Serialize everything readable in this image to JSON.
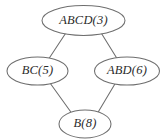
{
  "diagram": {
    "type": "lattice-hasse-diagram",
    "background_color": "#ffffff",
    "stroke_color": "#6e6e6e",
    "text_color": "#2b2b2b",
    "nodes": [
      {
        "id": "top",
        "label": "ABCD(3)",
        "set": "ABCD",
        "value": 3,
        "cx": 83.5,
        "cy": 20.5,
        "rx": 41.5,
        "ry": 15.0
      },
      {
        "id": "left",
        "label": "BC(5)",
        "set": "BC",
        "value": 5,
        "cx": 37.5,
        "cy": 71.0,
        "rx": 30.5,
        "ry": 14.0
      },
      {
        "id": "right",
        "label": "ABD(6)",
        "set": "ABD",
        "value": 6,
        "cx": 127.0,
        "cy": 71.0,
        "rx": 32.5,
        "ry": 14.0
      },
      {
        "id": "bottom",
        "label": "B(8)",
        "set": "B",
        "value": 8,
        "cx": 85.0,
        "cy": 124.0,
        "rx": 26.0,
        "ry": 14.0
      }
    ],
    "edges": [
      {
        "id": "top-left",
        "from": "top",
        "to": "left",
        "x1": 65.5,
        "y1": 33.5,
        "x2": 49.0,
        "y2": 58.5
      },
      {
        "id": "top-right",
        "from": "top",
        "to": "right",
        "x1": 101.5,
        "y1": 33.5,
        "x2": 117.0,
        "y2": 58.5
      },
      {
        "id": "left-bottom",
        "from": "left",
        "to": "bottom",
        "x1": 50.0,
        "y1": 83.0,
        "x2": 70.5,
        "y2": 111.5
      },
      {
        "id": "right-bottom",
        "from": "right",
        "to": "bottom",
        "x1": 115.5,
        "y1": 83.0,
        "x2": 98.5,
        "y2": 111.5
      }
    ]
  }
}
